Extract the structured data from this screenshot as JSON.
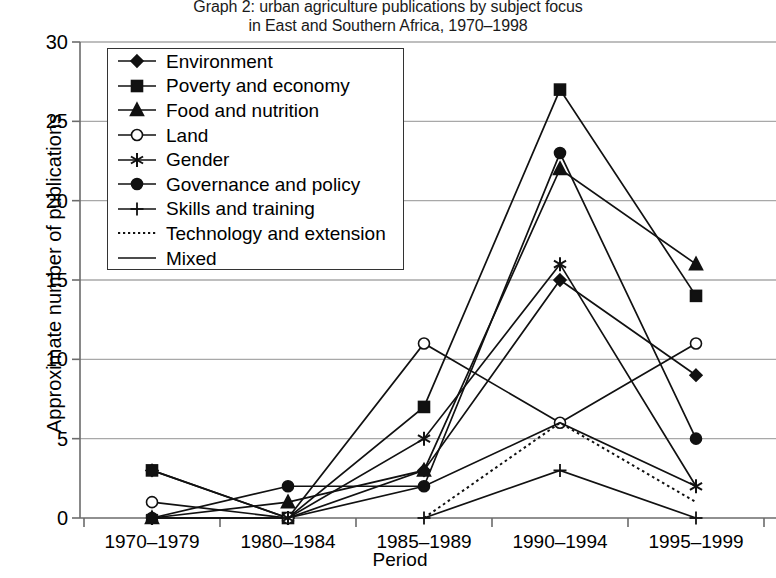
{
  "chart_data": {
    "type": "line",
    "title": "Graph 2: urban agriculture publications by subject focus",
    "subtitle": "in East and Southern Africa, 1970–1998",
    "xlabel": "Period",
    "ylabel": "Approximate number of publications",
    "categories": [
      "1970–1979",
      "1980–1984",
      "1985–1989",
      "1990–1994",
      "1995–1999"
    ],
    "ylim": [
      0,
      30
    ],
    "yticks": [
      0,
      5,
      10,
      15,
      20,
      25,
      30
    ],
    "grid": "horizontal",
    "legend_position": "upper-left-inside",
    "series": [
      {
        "name": "Environment",
        "marker": "diamond",
        "line": "solid",
        "values": [
          3,
          0,
          3,
          15,
          9
        ]
      },
      {
        "name": "Poverty and economy",
        "marker": "square",
        "line": "solid",
        "values": [
          3,
          0,
          7,
          27,
          14
        ]
      },
      {
        "name": "Food and nutrition",
        "marker": "triangle",
        "line": "solid",
        "values": [
          0,
          1,
          3,
          22,
          16
        ]
      },
      {
        "name": "Land",
        "marker": "circle-open",
        "line": "solid",
        "values": [
          1,
          0,
          11,
          6,
          11
        ]
      },
      {
        "name": "Gender",
        "marker": "asterisk",
        "line": "solid",
        "values": [
          0,
          0,
          5,
          16,
          2
        ]
      },
      {
        "name": "Governance and policy",
        "marker": "circle",
        "line": "solid",
        "values": [
          0,
          2,
          2,
          23,
          5
        ]
      },
      {
        "name": "Skills and training",
        "marker": "plus",
        "line": "solid",
        "values": [
          null,
          null,
          0,
          3,
          0
        ]
      },
      {
        "name": "Technology and extension",
        "marker": "none",
        "line": "dotted",
        "values": [
          null,
          null,
          0,
          6,
          1
        ]
      },
      {
        "name": "Mixed",
        "marker": "none",
        "line": "solid",
        "values": [
          0,
          0,
          2,
          6,
          2
        ]
      }
    ],
    "colors": {
      "series": "#111111",
      "grid": "#a8a8a8",
      "axis": "#6b6b6b",
      "background": "#ffffff"
    }
  }
}
